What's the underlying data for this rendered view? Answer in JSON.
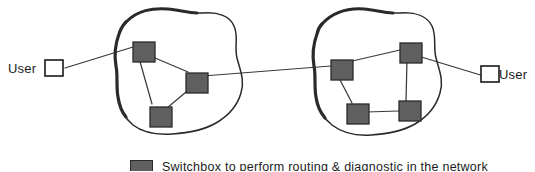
{
  "figure": {
    "background_color": "#ffffff"
  },
  "endpoints": [
    {
      "id": "user-left",
      "label": "User",
      "label_side": "left",
      "x": 55,
      "y": 68
    },
    {
      "id": "user-right",
      "label": "User",
      "label_side": "right",
      "x": 487,
      "y": 74
    }
  ],
  "clouds": [
    {
      "id": "cloud-left",
      "name": "left-network-cloud"
    },
    {
      "id": "cloud-right",
      "name": "right-network-cloud"
    }
  ],
  "nodes": [
    {
      "id": "n1",
      "cloud": "cloud-left",
      "x": 133,
      "y": 42,
      "w": 22,
      "h": 20
    },
    {
      "id": "n2",
      "cloud": "cloud-left",
      "x": 186,
      "y": 73,
      "w": 22,
      "h": 20
    },
    {
      "id": "n3",
      "cloud": "cloud-left",
      "x": 150,
      "y": 107,
      "w": 22,
      "h": 20
    },
    {
      "id": "n4",
      "cloud": "cloud-right",
      "x": 331,
      "y": 60,
      "w": 22,
      "h": 20
    },
    {
      "id": "n5",
      "cloud": "cloud-right",
      "x": 400,
      "y": 43,
      "w": 22,
      "h": 20
    },
    {
      "id": "n6",
      "cloud": "cloud-right",
      "x": 347,
      "y": 104,
      "w": 22,
      "h": 20
    },
    {
      "id": "n7",
      "cloud": "cloud-right",
      "x": 399,
      "y": 101,
      "w": 22,
      "h": 20
    }
  ],
  "links": [
    {
      "from": "user-left",
      "to": "n1"
    },
    {
      "from": "n1",
      "to": "n2"
    },
    {
      "from": "n1",
      "to": "n3"
    },
    {
      "from": "n2",
      "to": "n3"
    },
    {
      "from": "n2",
      "to": "n4"
    },
    {
      "from": "n4",
      "to": "n5"
    },
    {
      "from": "n4",
      "to": "n6"
    },
    {
      "from": "n5",
      "to": "n7"
    },
    {
      "from": "n6",
      "to": "n7"
    },
    {
      "from": "n5",
      "to": "user-right"
    }
  ],
  "legend": {
    "swatch_color": "#5f5f5f",
    "text": "Switchbox to perform routing & diagnostic in the network"
  },
  "colors": {
    "node_fill": "#5f5f5f",
    "node_stroke": "#2a2a2a",
    "line": "#3a3a3a",
    "cloud_stroke": "#2a2a2a",
    "endpoint_fill": "#ffffff",
    "text": "#1a1a1a"
  }
}
